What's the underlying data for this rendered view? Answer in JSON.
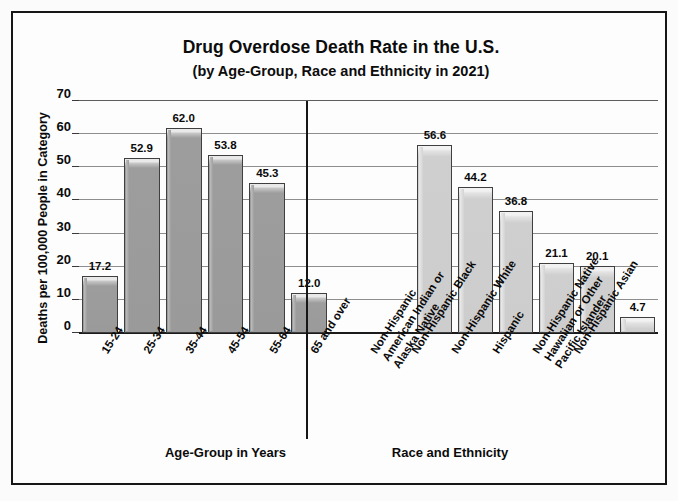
{
  "chart_data": {
    "type": "bar",
    "title": "Drug Overdose Death Rate in the U.S.",
    "subtitle": "(by Age-Group, Race and Ethnicity in 2021)",
    "ylabel": "Deaths per 100,000 People in Category",
    "ylim": [
      0,
      70
    ],
    "yticks": [
      0,
      10,
      20,
      30,
      40,
      50,
      60,
      70
    ],
    "ytick_labels": [
      "0",
      "10",
      "20",
      "30",
      "40",
      "50",
      "60",
      "70"
    ],
    "grid": true,
    "legend": "none",
    "panels": [
      {
        "name": "age-group",
        "xlabel": "Age-Group in Years",
        "categories": [
          "15-24",
          "25-34",
          "35-44",
          "45-54",
          "55-64",
          "65 and over"
        ],
        "category_lines": [
          [
            "15-24"
          ],
          [
            "25-34"
          ],
          [
            "35-44"
          ],
          [
            "45-54"
          ],
          [
            "55-64"
          ],
          [
            "65 and over"
          ]
        ],
        "values": [
          17.2,
          52.9,
          62.0,
          53.8,
          45.3,
          12.0
        ],
        "value_labels": [
          "17.2",
          "52.9",
          "62.0",
          "53.8",
          "45.3",
          "12.0"
        ],
        "bar_color": "#9a9a9a"
      },
      {
        "name": "race-and-ethnicity",
        "xlabel": "Race and Ethnicity",
        "categories": [
          "Non-Hispanic American Indian or Alaska Native",
          "Non-Hispanic Black",
          "Non-Hispanic White",
          "Hispanic",
          "Non-Hispanic Native Hawaiian or Other Pacific Islander",
          "Non-Hispanic Asian"
        ],
        "category_lines": [
          [
            "Non-Hispanic",
            "American Indian or",
            "Alaska Native"
          ],
          [
            "Non-Hispanic Black"
          ],
          [
            "Non-Hispanic White"
          ],
          [
            "Hispanic"
          ],
          [
            "Non-Hispanic Native",
            "Hawaiian or Other",
            "Pacific Islander"
          ],
          [
            "Non-Hispanic Asian"
          ]
        ],
        "values": [
          56.6,
          44.2,
          36.8,
          21.1,
          20.1,
          4.7
        ],
        "value_labels": [
          "56.6",
          "44.2",
          "36.8",
          "21.1",
          "20.1",
          "4.7"
        ],
        "bar_color": "#cdcdcd"
      }
    ]
  }
}
